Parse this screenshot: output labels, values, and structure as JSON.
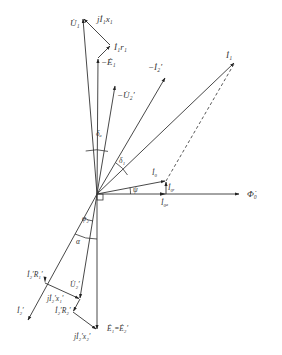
{
  "diagram": {
    "origin": [
      97,
      194
    ],
    "vectors": [
      {
        "id": "U1",
        "label": "U̇₁",
        "from": [
          97,
          194
        ],
        "to": [
          83,
          18
        ]
      },
      {
        "id": "jI1x1",
        "label": "jİ₁x₁",
        "from": [
          110,
          45
        ],
        "to": [
          83,
          18
        ]
      },
      {
        "id": "I1r1",
        "label": "İ₁r₁",
        "from": [
          98,
          58
        ],
        "to": [
          110,
          45
        ]
      },
      {
        "id": "minusE1",
        "label": "−Ė₁",
        "from": [
          97,
          194
        ],
        "to": [
          98,
          58
        ]
      },
      {
        "id": "minusU2p",
        "label": "−U̇₂′",
        "from": [
          97,
          194
        ],
        "to": [
          115,
          85
        ]
      },
      {
        "id": "minusI2p",
        "label": "−İ₂′",
        "from": [
          97,
          194
        ],
        "to": [
          166,
          77
        ]
      },
      {
        "id": "I1",
        "label": "İ₁",
        "from": [
          97,
          194
        ],
        "to": [
          235,
          62
        ]
      },
      {
        "id": "I0",
        "label": "İ₀",
        "from": [
          97,
          194
        ],
        "to": [
          166,
          181
        ]
      },
      {
        "id": "I0r",
        "label": "İ₀ᵣ",
        "from": [
          166,
          194
        ],
        "to": [
          166,
          181
        ]
      },
      {
        "id": "I0a",
        "label": "İ₀ₐ",
        "from": [
          97,
          194
        ],
        "to": [
          166,
          194
        ]
      },
      {
        "id": "Phi0",
        "label": "Φ̇₀",
        "from": [
          97,
          194
        ],
        "to": [
          240,
          194
        ]
      },
      {
        "id": "I2p",
        "label": "İ₂′",
        "from": [
          97,
          194
        ],
        "to": [
          28,
          321
        ]
      },
      {
        "id": "E1E2p",
        "label": "Ė₁=Ė₂′",
        "from": [
          97,
          194
        ],
        "to": [
          97,
          330
        ]
      },
      {
        "id": "U2p",
        "label": "U̇₂′",
        "from": [
          97,
          194
        ],
        "to": [
          80,
          299
        ]
      },
      {
        "id": "jI2px1p",
        "label": "jİ₂′x₁′",
        "from": [
          45,
          283
        ],
        "to": [
          80,
          299
        ]
      },
      {
        "id": "I2pR2p",
        "label": "İ₂′R₂′",
        "from": [
          80,
          299
        ],
        "to": [
          73,
          312
        ]
      },
      {
        "id": "jI2px2p",
        "label": "jİ₂′x₂′",
        "from": [
          73,
          312
        ],
        "to": [
          97,
          330
        ]
      }
    ],
    "dashed": [
      {
        "id": "I0-to-I1",
        "from": [
          166,
          181
        ],
        "to": [
          235,
          62
        ]
      }
    ],
    "angles": [
      {
        "id": "delta_a",
        "label": "δₐ"
      },
      {
        "id": "delta_1",
        "label": "δ₁"
      },
      {
        "id": "psi",
        "label": "ψ"
      },
      {
        "id": "phi_2",
        "label": "φ₂"
      },
      {
        "id": "alpha",
        "label": "α"
      }
    ],
    "labels": {
      "U1": "U̇₁",
      "jI1x1": "jİ₁x₁",
      "I1r1": "İ₁r₁",
      "minusE1": "−Ė₁",
      "minusU2p": "−U̇₂′",
      "minusI2p": "−İ₂′",
      "I1": "İ₁",
      "I0": "İ₀",
      "I0r": "İ₀ᵣ",
      "I0a": "İ₀ₐ",
      "Phi0": "Φ̇₀",
      "delta_a": "δₐ",
      "delta_1": "δ₁",
      "psi": "ψ",
      "phi_2": "φ₂",
      "alpha": "α",
      "I2pR1p": "İ₂′R₁′",
      "U2p": "U̇₂′",
      "jI2px1p": "jİ₂′x₁′",
      "I2p": "İ₂′",
      "I2pR2p": "İ₂′R₂′",
      "jI2px2p": "jİ₂′x₂′",
      "E1E2p": "Ė₁=Ė₂′"
    }
  }
}
